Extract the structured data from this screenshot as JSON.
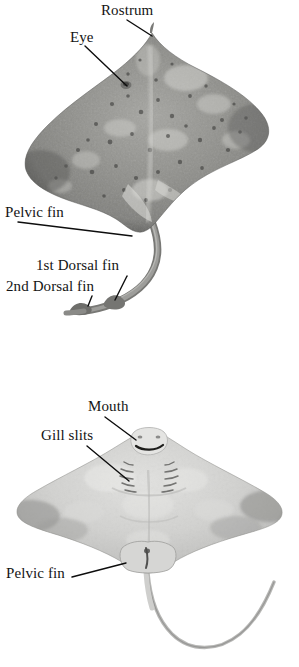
{
  "figure": {
    "background_color": "#ffffff",
    "label_color": "#141414",
    "leader_line_color": "#0d0d0d",
    "width": 299,
    "height": 667
  },
  "panels": [
    {
      "id": "dorsal",
      "view_name": "dorsal-view",
      "specimen": "skate",
      "body_tone": "#8d8d8d",
      "labels": [
        {
          "key": "rostrum",
          "text": "Rostrum",
          "name": "label-rostrum"
        },
        {
          "key": "eye",
          "text": "Eye",
          "name": "label-eye"
        },
        {
          "key": "pelvic",
          "text": "Pelvic fin",
          "name": "label-pelvic-fin-dorsal"
        },
        {
          "key": "dorsal1",
          "text": "1st Dorsal fin",
          "name": "label-first-dorsal-fin"
        },
        {
          "key": "dorsal2",
          "text": "2nd Dorsal fin",
          "name": "label-second-dorsal-fin"
        }
      ]
    },
    {
      "id": "ventral",
      "view_name": "ventral-view",
      "specimen": "skate",
      "body_tone": "#c2c2c2",
      "labels": [
        {
          "key": "mouth",
          "text": "Mouth",
          "name": "label-mouth"
        },
        {
          "key": "gillslits",
          "text": "Gill slits",
          "name": "label-gill-slits"
        },
        {
          "key": "pelvic",
          "text": "Pelvic fin",
          "name": "label-pelvic-fin-ventral"
        }
      ]
    }
  ],
  "labels_flat": {
    "rostrum": "Rostrum",
    "eye": "Eye",
    "pelvic_top": "Pelvic fin",
    "dorsal_first": "1st Dorsal fin",
    "dorsal_second": "2nd Dorsal fin",
    "mouth": "Mouth",
    "gill_slits": "Gill slits",
    "pelvic_bottom": "Pelvic fin"
  }
}
